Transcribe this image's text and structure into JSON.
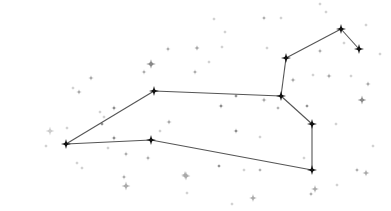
{
  "figure": {
    "width": 391,
    "height": 211,
    "colors": {
      "background": "#ffffff",
      "line": "#555555",
      "main_star": "#111111",
      "faint_star_dark": "#888888",
      "faint_star_mid": "#aaaaaa",
      "faint_star_light": "#cccccc"
    },
    "main_stars": [
      {
        "id": "s1",
        "x": 66,
        "y": 144
      },
      {
        "id": "s2",
        "x": 154,
        "y": 91
      },
      {
        "id": "s3",
        "x": 151,
        "y": 140
      },
      {
        "id": "s4",
        "x": 281,
        "y": 96
      },
      {
        "id": "s5",
        "x": 286,
        "y": 58
      },
      {
        "id": "s6",
        "x": 341,
        "y": 29
      },
      {
        "id": "s7",
        "x": 359,
        "y": 49
      },
      {
        "id": "s8",
        "x": 312,
        "y": 124
      },
      {
        "id": "s9",
        "x": 312,
        "y": 170
      }
    ],
    "lines": [
      [
        "s1",
        "s2"
      ],
      [
        "s2",
        "s4"
      ],
      [
        "s4",
        "s5"
      ],
      [
        "s5",
        "s6"
      ],
      [
        "s6",
        "s7"
      ],
      [
        "s4",
        "s8"
      ],
      [
        "s8",
        "s9"
      ],
      [
        "s9",
        "s3"
      ],
      [
        "s3",
        "s1"
      ]
    ],
    "background_stars": [
      {
        "x": 151,
        "y": 64,
        "r": 2.2,
        "tone": "dark"
      },
      {
        "x": 168,
        "y": 49,
        "r": 1.2,
        "tone": "mid"
      },
      {
        "x": 144,
        "y": 72,
        "r": 1.2,
        "tone": "mid"
      },
      {
        "x": 91,
        "y": 78,
        "r": 1.3,
        "tone": "mid"
      },
      {
        "x": 79,
        "y": 92,
        "r": 1.3,
        "tone": "mid"
      },
      {
        "x": 73,
        "y": 88,
        "r": 1.0,
        "tone": "light"
      },
      {
        "x": 214,
        "y": 19,
        "r": 1.0,
        "tone": "light"
      },
      {
        "x": 197,
        "y": 48,
        "r": 1.2,
        "tone": "mid"
      },
      {
        "x": 195,
        "y": 72,
        "r": 1.2,
        "tone": "mid"
      },
      {
        "x": 209,
        "y": 62,
        "r": 1.0,
        "tone": "light"
      },
      {
        "x": 264,
        "y": 18,
        "r": 1.1,
        "tone": "mid"
      },
      {
        "x": 281,
        "y": 18,
        "r": 1.0,
        "tone": "light"
      },
      {
        "x": 225,
        "y": 32,
        "r": 1.0,
        "tone": "light"
      },
      {
        "x": 197,
        "y": 48,
        "r": 1.1,
        "tone": "mid"
      },
      {
        "x": 267,
        "y": 48,
        "r": 1.0,
        "tone": "light"
      },
      {
        "x": 222,
        "y": 47,
        "r": 1.0,
        "tone": "light"
      },
      {
        "x": 320,
        "y": 4,
        "r": 1.0,
        "tone": "light"
      },
      {
        "x": 326,
        "y": 12,
        "r": 1.0,
        "tone": "light"
      },
      {
        "x": 366,
        "y": 25,
        "r": 1.0,
        "tone": "light"
      },
      {
        "x": 380,
        "y": 54,
        "r": 1.0,
        "tone": "light"
      },
      {
        "x": 320,
        "y": 51,
        "r": 1.2,
        "tone": "mid"
      },
      {
        "x": 344,
        "y": 43,
        "r": 1.0,
        "tone": "light"
      },
      {
        "x": 313,
        "y": 75,
        "r": 1.0,
        "tone": "light"
      },
      {
        "x": 329,
        "y": 76,
        "r": 1.3,
        "tone": "mid"
      },
      {
        "x": 351,
        "y": 76,
        "r": 1.0,
        "tone": "light"
      },
      {
        "x": 368,
        "y": 84,
        "r": 1.3,
        "tone": "mid"
      },
      {
        "x": 362,
        "y": 100,
        "r": 2.0,
        "tone": "dark"
      },
      {
        "x": 293,
        "y": 80,
        "r": 1.3,
        "tone": "mid"
      },
      {
        "x": 264,
        "y": 100,
        "r": 1.3,
        "tone": "mid"
      },
      {
        "x": 307,
        "y": 106,
        "r": 1.0,
        "tone": "dark"
      },
      {
        "x": 336,
        "y": 124,
        "r": 1.0,
        "tone": "light"
      },
      {
        "x": 373,
        "y": 146,
        "r": 1.0,
        "tone": "light"
      },
      {
        "x": 304,
        "y": 158,
        "r": 1.0,
        "tone": "light"
      },
      {
        "x": 357,
        "y": 170,
        "r": 1.1,
        "tone": "mid"
      },
      {
        "x": 366,
        "y": 173,
        "r": 1.6,
        "tone": "mid"
      },
      {
        "x": 337,
        "y": 185,
        "r": 1.0,
        "tone": "light"
      },
      {
        "x": 315,
        "y": 189,
        "r": 1.8,
        "tone": "mid"
      },
      {
        "x": 311,
        "y": 194,
        "r": 1.1,
        "tone": "mid"
      },
      {
        "x": 221,
        "y": 106,
        "r": 1.2,
        "tone": "dark"
      },
      {
        "x": 236,
        "y": 96,
        "r": 1.0,
        "tone": "dark"
      },
      {
        "x": 236,
        "y": 131,
        "r": 1.2,
        "tone": "dark"
      },
      {
        "x": 278,
        "y": 108,
        "r": 1.0,
        "tone": "mid"
      },
      {
        "x": 260,
        "y": 137,
        "r": 1.0,
        "tone": "light"
      },
      {
        "x": 219,
        "y": 166,
        "r": 1.0,
        "tone": "dark"
      },
      {
        "x": 244,
        "y": 170,
        "r": 1.0,
        "tone": "light"
      },
      {
        "x": 260,
        "y": 170,
        "r": 1.0,
        "tone": "mid"
      },
      {
        "x": 253,
        "y": 198,
        "r": 1.0,
        "tone": "light"
      },
      {
        "x": 232,
        "y": 204,
        "r": 1.0,
        "tone": "light"
      },
      {
        "x": 253,
        "y": 198,
        "r": 1.8,
        "tone": "mid"
      },
      {
        "x": 185,
        "y": 175,
        "r": 1.8,
        "tone": "mid"
      },
      {
        "x": 169,
        "y": 122,
        "r": 1.3,
        "tone": "mid"
      },
      {
        "x": 160,
        "y": 131,
        "r": 1.0,
        "tone": "light"
      },
      {
        "x": 114,
        "y": 108,
        "r": 1.2,
        "tone": "dark"
      },
      {
        "x": 102,
        "y": 124,
        "r": 1.0,
        "tone": "dark"
      },
      {
        "x": 104,
        "y": 117,
        "r": 1.0,
        "tone": "light"
      },
      {
        "x": 114,
        "y": 138,
        "r": 1.2,
        "tone": "dark"
      },
      {
        "x": 108,
        "y": 148,
        "r": 1.0,
        "tone": "light"
      },
      {
        "x": 126,
        "y": 154,
        "r": 1.2,
        "tone": "mid"
      },
      {
        "x": 148,
        "y": 158,
        "r": 1.2,
        "tone": "mid"
      },
      {
        "x": 124,
        "y": 177,
        "r": 1.2,
        "tone": "mid"
      },
      {
        "x": 126,
        "y": 186,
        "r": 2.0,
        "tone": "mid"
      },
      {
        "x": 186,
        "y": 176,
        "r": 2.0,
        "tone": "mid"
      },
      {
        "x": 187,
        "y": 193,
        "r": 1.0,
        "tone": "light"
      },
      {
        "x": 50,
        "y": 131,
        "r": 2.0,
        "tone": "light"
      },
      {
        "x": 46,
        "y": 146,
        "r": 1.0,
        "tone": "light"
      },
      {
        "x": 67,
        "y": 128,
        "r": 1.0,
        "tone": "light"
      },
      {
        "x": 82,
        "y": 168,
        "r": 1.0,
        "tone": "light"
      },
      {
        "x": 77,
        "y": 163,
        "r": 1.0,
        "tone": "light"
      },
      {
        "x": 100,
        "y": 112,
        "r": 1.0,
        "tone": "light"
      }
    ]
  }
}
